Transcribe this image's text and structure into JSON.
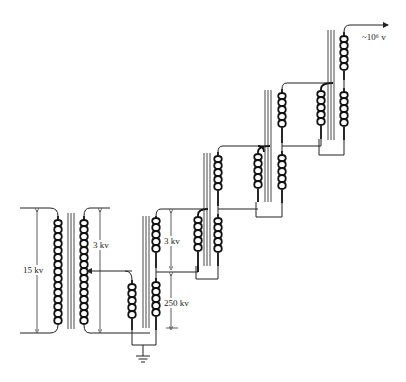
{
  "diagram": {
    "labels": {
      "input_voltage": "15 kv",
      "exciter_voltage": "3 kv",
      "stage_exciter_voltage": "3 kv",
      "stage_hv_voltage": "250 kv",
      "output_voltage": "~10⁶ v"
    },
    "stages": [
      {
        "id": "input-transformer",
        "primary": "15 kv",
        "secondary": "3 kv"
      },
      {
        "id": "stage-1",
        "exciter": "3 kv",
        "hv": "250 kv"
      },
      {
        "id": "stage-2"
      },
      {
        "id": "stage-3"
      },
      {
        "id": "stage-4"
      }
    ],
    "symbols": {
      "ground": "ground-icon",
      "output_arrow": "arrow-right-icon"
    },
    "colors": {
      "line": "#222222",
      "background": "#ffffff"
    }
  }
}
